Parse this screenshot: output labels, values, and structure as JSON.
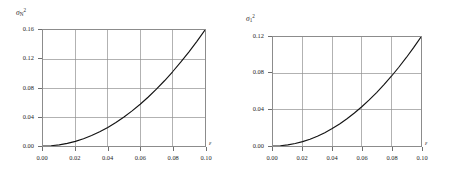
{
  "figure": {
    "background_color": "#ffffff",
    "curve_color": "#131313",
    "grid_color": "#8f8f8f",
    "frame_color": "#8c8c8c"
  },
  "chart_data": [
    {
      "type": "line",
      "title": "",
      "ylabel": "σ",
      "ylabel_sub": "N",
      "ylabel_sup": "2",
      "ylabel_full": "σₙ²",
      "xlabel": "ε",
      "xlim": [
        0.0,
        0.1
      ],
      "ylim": [
        0.0,
        0.16
      ],
      "grid": true,
      "legend": "none",
      "xticks": [
        0.0,
        0.02,
        0.04,
        0.06,
        0.08,
        0.1
      ],
      "xticklabels": [
        "0.00",
        "0.02",
        "0.04",
        "0.06",
        "0.08",
        "0.10"
      ],
      "yticks": [
        0.0,
        0.04,
        0.08,
        0.12,
        0.16
      ],
      "yticklabels": [
        "0.00",
        "0.04",
        "0.08",
        "0.12",
        "0.16"
      ],
      "x": [
        0.0,
        0.005,
        0.01,
        0.015,
        0.02,
        0.025,
        0.03,
        0.035,
        0.04,
        0.045,
        0.05,
        0.055,
        0.06,
        0.065,
        0.07,
        0.075,
        0.08,
        0.085,
        0.09,
        0.095,
        0.1
      ],
      "values": [
        0.0,
        0.0004,
        0.0016,
        0.0036,
        0.0064,
        0.01,
        0.0144,
        0.0196,
        0.0256,
        0.0324,
        0.04,
        0.0484,
        0.0576,
        0.0676,
        0.0784,
        0.09,
        0.1024,
        0.1156,
        0.1296,
        0.1444,
        0.16
      ]
    },
    {
      "type": "line",
      "title": "",
      "ylabel": "σ",
      "ylabel_sub": "1",
      "ylabel_sup": "2",
      "ylabel_full": "σ₁²",
      "xlabel": "ε",
      "xlim": [
        0.0,
        0.1
      ],
      "ylim": [
        0.0,
        0.12
      ],
      "grid": true,
      "legend": "none",
      "xticks": [
        0.0,
        0.02,
        0.04,
        0.06,
        0.08,
        0.1
      ],
      "xticklabels": [
        "0.00",
        "0.02",
        "0.04",
        "0.06",
        "0.08",
        "0.10"
      ],
      "yticks": [
        0.0,
        0.04,
        0.08,
        0.12
      ],
      "yticklabels": [
        "0.00",
        "0.04",
        "0.08",
        "0.12"
      ],
      "x": [
        0.0,
        0.005,
        0.01,
        0.015,
        0.02,
        0.025,
        0.03,
        0.035,
        0.04,
        0.045,
        0.05,
        0.055,
        0.06,
        0.065,
        0.07,
        0.075,
        0.08,
        0.085,
        0.09,
        0.095,
        0.1
      ],
      "values": [
        0.0,
        0.0003,
        0.0012,
        0.0027,
        0.0048,
        0.0075,
        0.0108,
        0.0147,
        0.0192,
        0.0243,
        0.03,
        0.0363,
        0.0432,
        0.0507,
        0.0588,
        0.0675,
        0.0768,
        0.0867,
        0.0972,
        0.1083,
        0.12
      ]
    }
  ]
}
